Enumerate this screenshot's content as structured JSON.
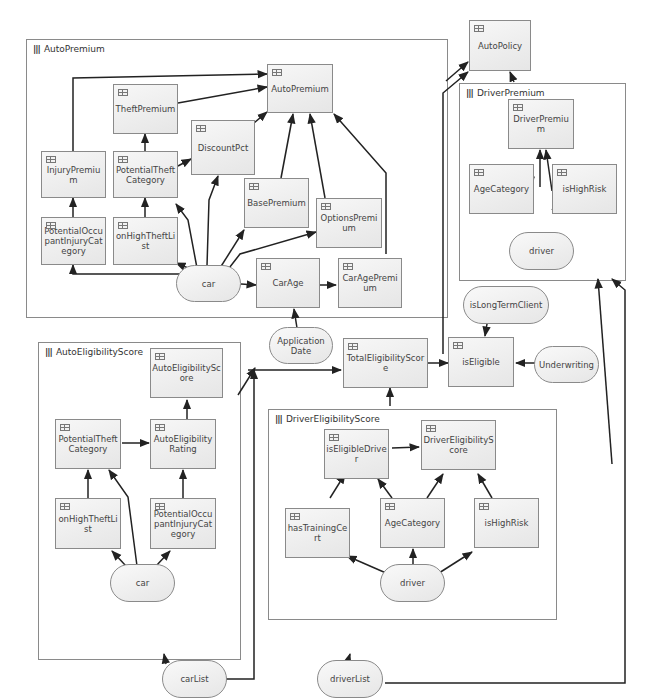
{
  "groups": {
    "auto_premium": {
      "title": "AutoPremium",
      "icon": "module-bars-icon"
    },
    "driver_premium": {
      "title": "DriverPremium",
      "icon": "module-bars-icon"
    },
    "auto_eligibility_score": {
      "title": "AutoEligibilityScore",
      "icon": "module-bars-icon"
    },
    "driver_eligibility_score": {
      "title": "DriverEligibilityScore",
      "icon": "module-bars-icon"
    }
  },
  "nodes": {
    "auto_policy": "AutoPolicy",
    "ap_auto_premium": "AutoPremium",
    "ap_theft_premium": "TheftPremium",
    "ap_discount_pct": "DiscountPct",
    "ap_injury_premium": "InjuryPremium",
    "ap_potential_theft_category": "PotentialTheftCategory",
    "ap_base_premium": "BasePremium",
    "ap_options_premium": "OptionsPremium",
    "ap_potential_occupant_injury_category": "PotentialOccupantInjuryCategory",
    "ap_on_high_theft_list": "onHighTheftList",
    "ap_car_age": "CarAge",
    "ap_car_age_premium": "CarAgePremium",
    "dp_driver_premium": "DriverPremium",
    "dp_age_category": "AgeCategory",
    "dp_is_high_risk": "isHighRisk",
    "total_eligibility_score": "TotalEligibilityScore",
    "is_eligible": "isEligible",
    "aes_auto_eligibility_score": "AutoEligibilityScore",
    "aes_potential_theft_category": "PotentialTheftCategory",
    "aes_auto_eligibility_rating": "AutoEligibilityRating",
    "aes_on_high_theft_list": "onHighTheftList",
    "aes_potential_occupant_injury_category": "PotentialOccupantInjuryCategory",
    "des_is_eligible_driver": "isEligibleDriver",
    "des_driver_eligibility_score": "DriverEligibilityScore",
    "des_has_training_cert": "hasTrainingCert",
    "des_age_category": "AgeCategory",
    "des_is_high_risk": "isHighRisk"
  },
  "inputs": {
    "ap_car": "car",
    "dp_driver": "driver",
    "application_date": "Application Date",
    "is_long_term_client": "isLongTermClient",
    "underwriting": "Underwriting",
    "aes_car": "car",
    "des_driver": "driver",
    "car_list": "carList",
    "driver_list": "driverList"
  },
  "node_icon": "table-icon",
  "colors": {
    "border": "#8a8a8a",
    "edge": "#222222",
    "node_fill": "#ececec",
    "text": "#444444"
  }
}
